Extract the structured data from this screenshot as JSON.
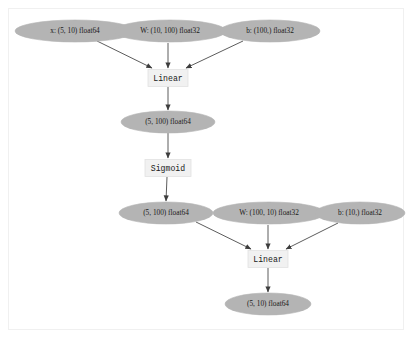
{
  "diagram": {
    "type": "directed-acyclic-graph",
    "background_color": "#ffffff",
    "panel_border_color": "#f0f0f0",
    "node_fill_data": "#b4b4b4",
    "node_fill_op": "#f1f1f1",
    "edge_color": "#4a4a4a",
    "nodes": [
      {
        "id": "x_in",
        "label": "x: (5, 10) float64",
        "shape": "ellipse",
        "kind": "data",
        "cx": 75,
        "cy": 31,
        "rx": 60,
        "ry": 11
      },
      {
        "id": "w1",
        "label": "W: (10, 100) float32",
        "shape": "ellipse",
        "kind": "parameter",
        "cx": 170,
        "cy": 31,
        "rx": 56,
        "ry": 11
      },
      {
        "id": "b1",
        "label": "b: (100,) float32",
        "shape": "ellipse",
        "kind": "parameter",
        "cx": 270,
        "cy": 31,
        "rx": 50,
        "ry": 11
      },
      {
        "id": "linear1",
        "label": "Linear",
        "shape": "box",
        "kind": "operation",
        "cx": 168,
        "cy": 78,
        "w": 40,
        "h": 17
      },
      {
        "id": "hidden",
        "label": "(5, 100) float64",
        "shape": "ellipse",
        "kind": "data",
        "cx": 168,
        "cy": 122,
        "rx": 47,
        "ry": 11
      },
      {
        "id": "sigmoid",
        "label": "Sigmoid",
        "shape": "box",
        "kind": "operation",
        "cx": 168,
        "cy": 168,
        "w": 46,
        "h": 17
      },
      {
        "id": "act",
        "label": "(5, 100) float64",
        "shape": "ellipse",
        "kind": "data",
        "cx": 166,
        "cy": 213,
        "rx": 47,
        "ry": 11
      },
      {
        "id": "w2",
        "label": "W: (100, 10) float32",
        "shape": "ellipse",
        "kind": "parameter",
        "cx": 269,
        "cy": 213,
        "rx": 56,
        "ry": 11
      },
      {
        "id": "b2",
        "label": "b: (10,) float32",
        "shape": "ellipse",
        "kind": "parameter",
        "cx": 360,
        "cy": 213,
        "rx": 45,
        "ry": 11
      },
      {
        "id": "linear2",
        "label": "Linear",
        "shape": "box",
        "kind": "operation",
        "cx": 268,
        "cy": 259,
        "w": 40,
        "h": 17
      },
      {
        "id": "output",
        "label": "(5, 10) float64",
        "shape": "ellipse",
        "kind": "data",
        "cx": 268,
        "cy": 304,
        "rx": 43,
        "ry": 11
      }
    ],
    "edges": [
      {
        "from": "x_in",
        "to": "linear1",
        "x1": 97,
        "y1": 41,
        "x2": 152,
        "y2": 68
      },
      {
        "from": "w1",
        "to": "linear1",
        "x1": 168,
        "y1": 43,
        "x2": 168,
        "y2": 68
      },
      {
        "from": "b1",
        "to": "linear1",
        "x1": 243,
        "y1": 41,
        "x2": 186,
        "y2": 68
      },
      {
        "from": "linear1",
        "to": "hidden",
        "x1": 168,
        "y1": 87,
        "x2": 168,
        "y2": 110
      },
      {
        "from": "hidden",
        "to": "sigmoid",
        "x1": 168,
        "y1": 133,
        "x2": 168,
        "y2": 158
      },
      {
        "from": "sigmoid",
        "to": "act",
        "x1": 167,
        "y1": 177,
        "x2": 166,
        "y2": 201
      },
      {
        "from": "act",
        "to": "linear2",
        "x1": 196,
        "y1": 222,
        "x2": 251,
        "y2": 249
      },
      {
        "from": "w2",
        "to": "linear2",
        "x1": 268,
        "y1": 225,
        "x2": 268,
        "y2": 249
      },
      {
        "from": "b2",
        "to": "linear2",
        "x1": 338,
        "y1": 223,
        "x2": 286,
        "y2": 249
      },
      {
        "from": "linear2",
        "to": "output",
        "x1": 268,
        "y1": 268,
        "x2": 268,
        "y2": 292
      }
    ]
  }
}
